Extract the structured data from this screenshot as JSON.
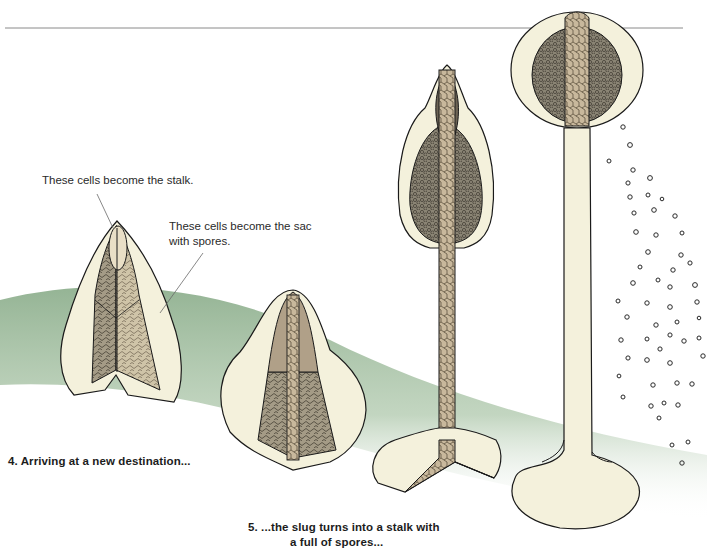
{
  "diagram": {
    "colors": {
      "background": "#ffffff",
      "ground_green": "#8fb08f",
      "cream": "#f4f1dc",
      "stalk_tan": "#b9a58a",
      "spore_mass": "#8a8474",
      "outline": "#1a1a1a",
      "rule_line": "#888888"
    },
    "annotations": [
      {
        "id": "stalk-cells",
        "text": "These cells become the stalk."
      },
      {
        "id": "sac-cells",
        "line1": "These cells become the sac",
        "line2": "with spores."
      }
    ],
    "captions": {
      "step4": "4. Arriving at a new destination...",
      "step5_line1": "5. ...the slug turns into a stalk with",
      "step5_line2": "a full of spores..."
    },
    "stages": [
      {
        "index": 1,
        "description": "Slug cross-section with stalk and spore cells"
      },
      {
        "index": 2,
        "description": "Slug flattening, stalk forming in center"
      },
      {
        "index": 3,
        "description": "Stalk elongating with base disc"
      },
      {
        "index": 4,
        "description": "Mature fruiting body releasing spores"
      }
    ]
  }
}
